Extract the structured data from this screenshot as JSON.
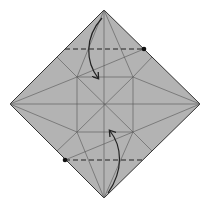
{
  "diagram": {
    "type": "origami-fold-step",
    "paper_color": "#b3b3b3",
    "line_color": "#333333",
    "crease_color": "#555555",
    "folds": [
      {
        "kind": "valley-fold",
        "position": "top",
        "direction": "fold tip down to inner square"
      },
      {
        "kind": "valley-fold",
        "position": "bottom",
        "direction": "fold tip up to inner square"
      }
    ]
  }
}
